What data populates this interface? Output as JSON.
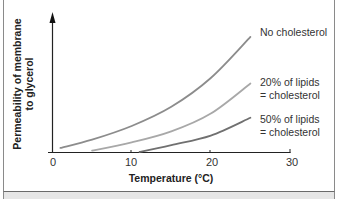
{
  "chart_data": {
    "type": "line",
    "title": "",
    "xlabel": "Temperature (°C)",
    "ylabel": "Permeability of membrane to glycerol",
    "xlim": [
      0,
      30
    ],
    "ylim": [
      0,
      1
    ],
    "x_ticks": [
      "0",
      "10",
      "20",
      "30"
    ],
    "y_ticks": [],
    "grid": false,
    "legend_position": "inline-right",
    "series": [
      {
        "name": "No cholesterol",
        "label_lines": [
          "No cholesterol"
        ],
        "x": [
          1,
          5,
          10,
          15,
          20,
          25
        ],
        "y": [
          0.03,
          0.09,
          0.19,
          0.33,
          0.54,
          0.84
        ],
        "color": "#8c8c8c"
      },
      {
        "name": "20% of lipids = cholesterol",
        "label_lines": [
          "20% of lipids",
          "= cholesterol"
        ],
        "x": [
          5,
          10,
          15,
          20,
          25
        ],
        "y": [
          0.01,
          0.07,
          0.15,
          0.28,
          0.5
        ],
        "color": "#a8a8a8"
      },
      {
        "name": "50% of lipids = cholesterol",
        "label_lines": [
          "50% of lipids",
          "= cholesterol"
        ],
        "x": [
          11,
          15,
          20,
          25
        ],
        "y": [
          0.0,
          0.05,
          0.12,
          0.25
        ],
        "color": "#707070"
      }
    ]
  },
  "labels": {
    "ylabel_line1": "Permeability of membrane",
    "ylabel_line2": "to glycerol",
    "xlabel": "Temperature (°C)",
    "tick0": "0",
    "tick10": "10",
    "tick20": "20",
    "tick30": "30",
    "legend_no_chol": "No cholesterol",
    "legend_20_l1": "20% of lipids",
    "legend_20_l2": "= cholesterol",
    "legend_50_l1": "50% of lipids",
    "legend_50_l2": "= cholesterol"
  }
}
